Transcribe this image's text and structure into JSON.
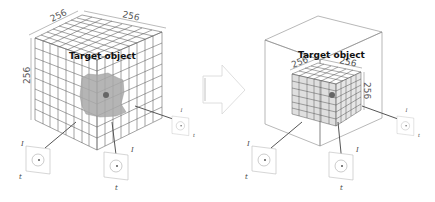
{
  "left_panel": {
    "title": "Target object",
    "dim_top_left": "256",
    "dim_top_right": "256",
    "dim_left": "256",
    "sensors": [
      {
        "id": "left",
        "label_top": "I",
        "label_bottom": "t",
        "inner": "g"
      },
      {
        "id": "bottom",
        "label_top": "I",
        "label_bottom": "t",
        "inner": "g"
      },
      {
        "id": "right",
        "label_top": "I",
        "label_bottom": "t",
        "inner": "g"
      }
    ]
  },
  "arrow": {
    "direction": "right"
  },
  "right_panel": {
    "title": "Target object",
    "dim_top_left": "256",
    "dim_top_right": "256",
    "dim_right": "256",
    "sensors": [
      {
        "id": "left",
        "label_top": "I",
        "label_bottom": "t",
        "inner": "g"
      },
      {
        "id": "bottom",
        "label_top": "I",
        "label_bottom": "t",
        "inner": "g"
      },
      {
        "id": "right",
        "label_top": "I",
        "label_bottom": "t",
        "inner": "g"
      }
    ]
  },
  "colors": {
    "grid": "#555555",
    "object": "#a8a8a8",
    "center_dot": "#666666",
    "arrow": "#dddddd"
  }
}
